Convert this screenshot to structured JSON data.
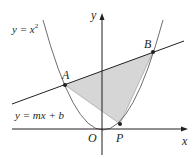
{
  "figure": {
    "colors": {
      "stroke": "#231f20",
      "curve": "#6d6e71",
      "shade": "#d6d6d6",
      "background": "#ffffff"
    },
    "labels": {
      "parabola": "y = x",
      "parabola_exp": "2",
      "line": "y = mx + b",
      "point_a": "A",
      "point_b": "B",
      "point_p": "P",
      "origin": "O",
      "x_axis": "x",
      "y_axis": "y"
    },
    "points": {
      "A": [
        65,
        85
      ],
      "B": [
        153,
        52
      ],
      "P": [
        120,
        124
      ],
      "O": [
        102,
        129
      ]
    },
    "shaded_region": "triangle APB"
  }
}
